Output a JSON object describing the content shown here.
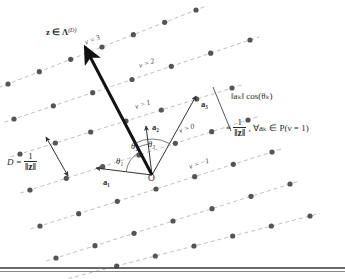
{
  "figure": {
    "type": "lattice-projection-diagram",
    "origin_label": "O",
    "vector_z_label_plain": "z ∈ Λ",
    "vector_z_superscript": "(D)",
    "spacing_label_lhs": "D =",
    "spacing_numerator": "1",
    "spacing_denominator": "‖z‖",
    "projection_expr": "‖aₖ‖ cos(θₖ)",
    "projection_eq_lhs": "=",
    "projection_eq_num": "1",
    "projection_eq_den": "‖z‖",
    "projection_eq_rhs": ", ∀aₖ ∈ P(ν = 1)",
    "angles": [
      "θ₁",
      "θ₂",
      "θ₃"
    ],
    "basis_vectors": [
      "a₁",
      "a₂",
      "a₃"
    ],
    "hyperplane_labels": [
      "ν = 3",
      "ν = 2",
      "ν = 1",
      "ν = 0",
      "ν = −1"
    ],
    "colors": {
      "lattice_point": "#555555",
      "dashed_line": "#b9b9b9",
      "vector_z": "#111111",
      "basis_vector": "#333333",
      "text": "#2b2b2b",
      "rule": "#3a3a3a",
      "background": "#ffffff"
    }
  },
  "chart_data": {
    "type": "scatter",
    "title": "",
    "xlabel": "",
    "ylabel": "",
    "hyperplanes": [
      {
        "nu": 3,
        "label": "ν = 3",
        "x1": 8,
        "y1": 84,
        "x2": 196,
        "y2": 10
      },
      {
        "nu": 2,
        "label": "ν = 2",
        "x1": 14,
        "y1": 119,
        "x2": 250,
        "y2": 40
      },
      {
        "nu": 1,
        "label": "ν = 1",
        "x1": 20,
        "y1": 154,
        "x2": 232,
        "y2": 88
      },
      {
        "nu": 0,
        "label": "ν = 0",
        "x1": 30,
        "y1": 190,
        "x2": 248,
        "y2": 120
      },
      {
        "nu": -1,
        "label": "ν = −1",
        "x1": 40,
        "y1": 226,
        "x2": 272,
        "y2": 152
      }
    ],
    "unlabeled_hyperplanes": [
      {
        "x1": 56,
        "y1": 258,
        "x2": 290,
        "y2": 184
      },
      {
        "x1": 78,
        "y1": 276,
        "x2": 310,
        "y2": 216
      }
    ],
    "origin": {
      "x": 152,
      "y": 175
    },
    "vectors": [
      {
        "name": "z",
        "x1": 152,
        "y1": 175,
        "x2": 85,
        "y2": 47,
        "style": "thick"
      },
      {
        "name": "a₁",
        "x1": 152,
        "y1": 175,
        "x2": 96,
        "y2": 168,
        "style": "thin"
      },
      {
        "name": "a₂",
        "x1": 152,
        "y1": 175,
        "x2": 146,
        "y2": 126,
        "style": "thin"
      },
      {
        "name": "a₃",
        "x1": 152,
        "y1": 175,
        "x2": 196,
        "y2": 96,
        "style": "thin"
      }
    ],
    "spacing_arrow": {
      "x1": 46,
      "y1": 137,
      "x2": 68,
      "y2": 176
    },
    "projection_segment": {
      "x1": 213,
      "y1": 87,
      "x2": 231,
      "y2": 131
    },
    "axis_ranges": {
      "x": [
        0,
        345
      ],
      "y": [
        0,
        279
      ]
    },
    "grid": false,
    "legend": "none"
  }
}
